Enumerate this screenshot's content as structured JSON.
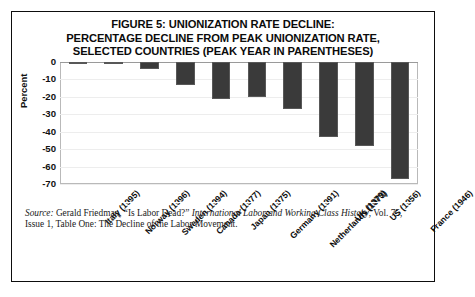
{
  "figure": {
    "title_lines": [
      "FIGURE 5: UNIONIZATION RATE DECLINE:",
      "PERCENTAGE DECLINE FROM PEAK UNIONIZATION RATE,",
      "SELECTED COUNTRIES (PEAK YEAR IN PARENTHESES)"
    ],
    "source": {
      "label": "Source:",
      "author": " Gerald Friedman, “Is Labor Dead?” ",
      "journal": "International Labor and Working Class History",
      "tail": ", Vol. 75, Issue 1, Table One: The Decline of the Labor Movement."
    }
  },
  "chart_data": {
    "type": "bar",
    "title": "FIGURE 5: UNIONIZATION RATE DECLINE: PERCENTAGE DECLINE FROM PEAK UNIONIZATION RATE, SELECTED COUNTRIES (PEAK YEAR IN PARENTHESES)",
    "xlabel": "",
    "ylabel": "Percent",
    "ylim": [
      -70,
      0
    ],
    "yticks": [
      0,
      -10,
      -20,
      -30,
      -40,
      -50,
      -60,
      -70
    ],
    "ytick_labels": [
      "0",
      "-10",
      "-20",
      "-30",
      "-40",
      "-50",
      "-60",
      "-70"
    ],
    "grid": true,
    "legend": "none",
    "orientation": "vertical",
    "bar_color": "#3a3a3a",
    "categories": [
      "Italy (1995)",
      "Norway (1996)",
      "Sweden (1994)",
      "Canada (1977)",
      "Japan (1975)",
      "Germany (1991)",
      "Netherlands (1973)",
      "UK (1979)",
      "US (1956)",
      "France (1946)"
    ],
    "values": [
      -0.5,
      -1,
      -4,
      -13,
      -21,
      -20,
      -27,
      -43,
      -48,
      -67
    ]
  }
}
